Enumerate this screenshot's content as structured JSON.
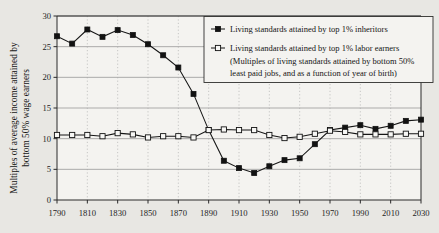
{
  "chart_data": {
    "type": "line",
    "title": "",
    "subtitle": "",
    "xlabel": "",
    "ylabel": "Multiples of average income attained by bottom 50% wage earners",
    "ylabel_line1": "Multiples of average income attained by",
    "ylabel_line2": "bottom 50% wage earners",
    "xlim": [
      1790,
      2030
    ],
    "ylim": [
      0,
      30
    ],
    "ytick_step": 5,
    "xtick_step": 20,
    "grid": "horizontal-solid-and-vertical-dotted",
    "legend_position": "top-right-inside",
    "x": [
      1790,
      1800,
      1810,
      1820,
      1830,
      1840,
      1850,
      1860,
      1870,
      1880,
      1890,
      1900,
      1910,
      1920,
      1930,
      1940,
      1950,
      1960,
      1970,
      1980,
      1990,
      2000,
      2010,
      2020,
      2030
    ],
    "xticks": [
      1790,
      1810,
      1830,
      1850,
      1870,
      1890,
      1910,
      1930,
      1950,
      1970,
      1990,
      2010,
      2030
    ],
    "yticks": [
      0,
      5,
      10,
      15,
      20,
      25,
      30
    ],
    "series": [
      {
        "name": "Living standards attained by top 1% inheritors",
        "marker": "filled-square",
        "values": [
          26.7,
          25.5,
          27.8,
          26.6,
          27.7,
          26.9,
          25.4,
          23.6,
          21.6,
          17.3,
          11.4,
          6.4,
          5.2,
          4.4,
          5.5,
          6.5,
          6.8,
          9.1,
          11.4,
          11.8,
          12.2,
          11.6,
          12.1,
          12.9,
          13.1
        ]
      },
      {
        "name": "Living standards attained by top 1% labor earners",
        "marker": "open-square",
        "values": [
          10.6,
          10.6,
          10.6,
          10.4,
          10.9,
          10.7,
          10.2,
          10.4,
          10.4,
          10.2,
          11.4,
          11.5,
          11.4,
          11.4,
          10.6,
          10.1,
          10.3,
          10.8,
          11.3,
          11.1,
          10.7,
          10.7,
          10.7,
          10.8,
          10.8
        ]
      }
    ]
  },
  "legend": {
    "entries": [
      {
        "marker": "filled-square",
        "label": "Living standards attained by top 1% inheritors",
        "note_lines": []
      },
      {
        "marker": "open-square",
        "label": "Living standards attained by top 1% labor earners",
        "note_lines": [
          "(Multiples of living standards attained by bottom 50%",
          "least paid jobs, and as a function of year of birth)"
        ]
      }
    ]
  },
  "colors": {
    "background": "#e8e7e3",
    "plot_background": "#f4f3f0",
    "ink": "#151515",
    "gridline": "#8d8d8d",
    "gridline_vertical": "#a8a8a8"
  }
}
